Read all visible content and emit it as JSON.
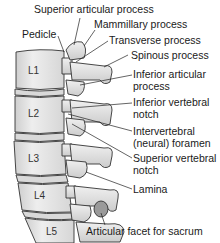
{
  "diagram": {
    "vertebrae": [
      "L1",
      "L2",
      "L3",
      "L4",
      "L5"
    ],
    "labels": {
      "superior_articular_process": "Superior articular process",
      "mammillary_process": "Mammillary process",
      "pedicle": "Pedicle",
      "transverse_process": "Transverse process",
      "spinous_process": "Spinous process",
      "inferior_articular_process_1": "Inferior articular",
      "inferior_articular_process_2": "process",
      "inferior_vertebral_notch_1": "Inferior vertebral",
      "inferior_vertebral_notch_2": "notch",
      "intervertebral_foramen_1": "Intervertebral",
      "intervertebral_foramen_2": "(neural) foramen",
      "superior_vertebral_notch_1": "Superior vertebral",
      "superior_vertebral_notch_2": "notch",
      "lamina": "Lamina",
      "articular_facet_sacrum": "Articular facet for sacrum"
    },
    "colors": {
      "bone_fill": "#e6e6e6",
      "bone_shade": "#c8c8c8",
      "outline": "#333333",
      "facet_fill": "#9a9a9a",
      "background": "#ffffff"
    }
  }
}
